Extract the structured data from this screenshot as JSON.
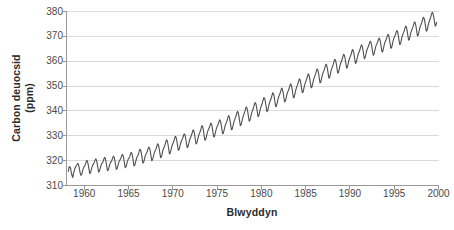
{
  "chart_data": {
    "type": "line",
    "title": "",
    "xlabel": "Blwyddyn",
    "ylabel": "Carbon deuocsid (ppm)",
    "ylabel_line1": "Carbon deuocsid",
    "ylabel_line2": "(ppm)",
    "xlim": [
      1958.0,
      2000.0
    ],
    "ylim": [
      310,
      380
    ],
    "xticks": [
      1960,
      1965,
      1970,
      1975,
      1980,
      1985,
      1990,
      1995,
      2000
    ],
    "xtick_labels": [
      "1960",
      "1965",
      "1970",
      "1975",
      "1980",
      "1985",
      "1990",
      "1995",
      "2000"
    ],
    "yticks": [
      310,
      320,
      330,
      340,
      350,
      360,
      370,
      380
    ],
    "ytick_labels": [
      "310",
      "320",
      "330",
      "340",
      "350",
      "360",
      "370",
      "380"
    ],
    "grid": "horizontal",
    "legend": "none",
    "line_color": "#4f4f4f",
    "grid_color": "#d9d9d9",
    "axis_color": "#9a9a9a",
    "text_color": "#4a4a4a",
    "series": [
      {
        "name": "Carbon deuocsid (ppm)",
        "x": [
          1958.208,
          1958.292,
          1958.375,
          1958.458,
          1958.542,
          1958.625,
          1958.708,
          1958.792,
          1958.875,
          1958.958,
          1959.042,
          1959.125,
          1959.208,
          1959.292,
          1959.375,
          1959.458,
          1959.542,
          1959.625,
          1959.708,
          1959.792,
          1959.875,
          1959.958,
          1960.042,
          1960.125,
          1960.208,
          1960.292,
          1960.375,
          1960.458,
          1960.542,
          1960.625,
          1960.708,
          1960.792,
          1960.875,
          1960.958,
          1961.042,
          1961.125,
          1961.208,
          1961.292,
          1961.375,
          1961.458,
          1961.542,
          1961.625,
          1961.708,
          1961.792,
          1961.875,
          1961.958,
          1962.042,
          1962.125,
          1962.208,
          1962.292,
          1962.375,
          1962.458,
          1962.542,
          1962.625,
          1962.708,
          1962.792,
          1962.875,
          1962.958,
          1963.042,
          1963.125,
          1963.208,
          1963.292,
          1963.375,
          1963.458,
          1963.542,
          1963.625,
          1963.708,
          1963.792,
          1963.875,
          1963.958,
          1964.042,
          1964.125,
          1964.208,
          1964.292,
          1964.375,
          1964.458,
          1964.542,
          1964.625,
          1964.708,
          1964.792,
          1964.875,
          1964.958,
          1965.042,
          1965.125,
          1965.208,
          1965.292,
          1965.375,
          1965.458,
          1965.542,
          1965.625,
          1965.708,
          1965.792,
          1965.875,
          1965.958,
          1966.042,
          1966.125,
          1966.208,
          1966.292,
          1966.375,
          1966.458,
          1966.542,
          1966.625,
          1966.708,
          1966.792,
          1966.875,
          1966.958,
          1967.042,
          1967.125,
          1967.208,
          1967.292,
          1967.375,
          1967.458,
          1967.542,
          1967.625,
          1967.708,
          1967.792,
          1967.875,
          1967.958,
          1968.042,
          1968.125,
          1968.208,
          1968.292,
          1968.375,
          1968.458,
          1968.542,
          1968.625,
          1968.708,
          1968.792,
          1968.875,
          1968.958,
          1969.042,
          1969.125,
          1969.208,
          1969.292,
          1969.375,
          1969.458,
          1969.542,
          1969.625,
          1969.708,
          1969.792,
          1969.875,
          1969.958,
          1970.042,
          1970.125,
          1970.208,
          1970.292,
          1970.375,
          1970.458,
          1970.542,
          1970.625,
          1970.708,
          1970.792,
          1970.875,
          1970.958,
          1971.042,
          1971.125,
          1971.208,
          1971.292,
          1971.375,
          1971.458,
          1971.542,
          1971.625,
          1971.708,
          1971.792,
          1971.875,
          1971.958,
          1972.042,
          1972.125,
          1972.208,
          1972.292,
          1972.375,
          1972.458,
          1972.542,
          1972.625,
          1972.708,
          1972.792,
          1972.875,
          1972.958,
          1973.042,
          1973.125,
          1973.208,
          1973.292,
          1973.375,
          1973.458,
          1973.542,
          1973.625,
          1973.708,
          1973.792,
          1973.875,
          1973.958,
          1974.042,
          1974.125,
          1974.208,
          1974.292,
          1974.375,
          1974.458,
          1974.542,
          1974.625,
          1974.708,
          1974.792,
          1974.875,
          1974.958,
          1975.042,
          1975.125,
          1975.208,
          1975.292,
          1975.375,
          1975.458,
          1975.542,
          1975.625,
          1975.708,
          1975.792,
          1975.875,
          1975.958,
          1976.042,
          1976.125,
          1976.208,
          1976.292,
          1976.375,
          1976.458,
          1976.542,
          1976.625,
          1976.708,
          1976.792,
          1976.875,
          1976.958,
          1977.042,
          1977.125,
          1977.208,
          1977.292,
          1977.375,
          1977.458,
          1977.542,
          1977.625,
          1977.708,
          1977.792,
          1977.875,
          1977.958,
          1978.042,
          1978.125,
          1978.208,
          1978.292,
          1978.375,
          1978.458,
          1978.542,
          1978.625,
          1978.708,
          1978.792,
          1978.875,
          1978.958,
          1979.042,
          1979.125,
          1979.208,
          1979.292,
          1979.375,
          1979.458,
          1979.542,
          1979.625,
          1979.708,
          1979.792,
          1979.875,
          1979.958,
          1980.042,
          1980.125,
          1980.208,
          1980.292,
          1980.375,
          1980.458,
          1980.542,
          1980.625,
          1980.708,
          1980.792,
          1980.875,
          1980.958,
          1981.042,
          1981.125,
          1981.208,
          1981.292,
          1981.375,
          1981.458,
          1981.542,
          1981.625,
          1981.708,
          1981.792,
          1981.875,
          1981.958,
          1982.042,
          1982.125,
          1982.208,
          1982.292,
          1982.375,
          1982.458,
          1982.542,
          1982.625,
          1982.708,
          1982.792,
          1982.875,
          1982.958,
          1983.042,
          1983.125,
          1983.208,
          1983.292,
          1983.375,
          1983.458,
          1983.542,
          1983.625,
          1983.708,
          1983.792,
          1983.875,
          1983.958,
          1984.042,
          1984.125,
          1984.208,
          1984.292,
          1984.375,
          1984.458,
          1984.542,
          1984.625,
          1984.708,
          1984.792,
          1984.875,
          1984.958,
          1985.042,
          1985.125,
          1985.208,
          1985.292,
          1985.375,
          1985.458,
          1985.542,
          1985.625,
          1985.708,
          1985.792,
          1985.875,
          1985.958,
          1986.042,
          1986.125,
          1986.208,
          1986.292,
          1986.375,
          1986.458,
          1986.542,
          1986.625,
          1986.708,
          1986.792,
          1986.875,
          1986.958,
          1987.042,
          1987.125,
          1987.208,
          1987.292,
          1987.375,
          1987.458,
          1987.542,
          1987.625,
          1987.708,
          1987.792,
          1987.875,
          1987.958,
          1988.042,
          1988.125,
          1988.208,
          1988.292,
          1988.375,
          1988.458,
          1988.542,
          1988.625,
          1988.708,
          1988.792,
          1988.875,
          1988.958,
          1989.042,
          1989.125,
          1989.208,
          1989.292,
          1989.375,
          1989.458,
          1989.542,
          1989.625,
          1989.708,
          1989.792,
          1989.875,
          1989.958,
          1990.042,
          1990.125,
          1990.208,
          1990.292,
          1990.375,
          1990.458,
          1990.542,
          1990.625,
          1990.708,
          1990.792,
          1990.875,
          1990.958,
          1991.042,
          1991.125,
          1991.208,
          1991.292,
          1991.375,
          1991.458,
          1991.542,
          1991.625,
          1991.708,
          1991.792,
          1991.875,
          1991.958,
          1992.042,
          1992.125,
          1992.208,
          1992.292,
          1992.375,
          1992.458,
          1992.542,
          1992.625,
          1992.708,
          1992.792,
          1992.875,
          1992.958,
          1993.042,
          1993.125,
          1993.208,
          1993.292,
          1993.375,
          1993.458,
          1993.542,
          1993.625,
          1993.708,
          1993.792,
          1993.875,
          1993.958,
          1994.042,
          1994.125,
          1994.208,
          1994.292,
          1994.375,
          1994.458,
          1994.542,
          1994.625,
          1994.708,
          1994.792,
          1994.875,
          1994.958,
          1995.042,
          1995.125,
          1995.208,
          1995.292,
          1995.375,
          1995.458,
          1995.542,
          1995.625,
          1995.708,
          1995.792,
          1995.875,
          1995.958,
          1996.042,
          1996.125,
          1996.208,
          1996.292,
          1996.375,
          1996.458,
          1996.542,
          1996.625,
          1996.708,
          1996.792,
          1996.875,
          1996.958,
          1997.042,
          1997.125,
          1997.208,
          1997.292,
          1997.375,
          1997.458,
          1997.542,
          1997.625,
          1997.708,
          1997.792,
          1997.875,
          1997.958,
          1998.042,
          1998.125,
          1998.208,
          1998.292,
          1998.375,
          1998.458,
          1998.542,
          1998.625,
          1998.708,
          1998.792,
          1998.875,
          1998.958,
          1999.042,
          1999.125,
          1999.208,
          1999.292,
          1999.375,
          1999.458,
          1999.542,
          1999.625,
          1999.708,
          1999.792
        ],
        "y": [
          315.7,
          317.5,
          317.5,
          317.0,
          315.2,
          314.0,
          313.2,
          314.9,
          315.9,
          317.0,
          317.5,
          318.2,
          318.5,
          318.9,
          318.2,
          316.7,
          315.0,
          314.1,
          314.3,
          315.6,
          316.6,
          317.4,
          317.8,
          318.4,
          319.4,
          320.1,
          319.6,
          318.3,
          316.5,
          314.8,
          315.2,
          316.2,
          317.4,
          318.2,
          318.6,
          319.2,
          320.0,
          320.7,
          320.3,
          319.0,
          317.2,
          315.4,
          315.7,
          316.7,
          317.8,
          318.7,
          319.0,
          319.6,
          320.5,
          321.3,
          321.0,
          319.6,
          317.8,
          316.0,
          316.2,
          317.2,
          318.4,
          319.2,
          319.6,
          320.2,
          321.0,
          321.8,
          321.4,
          320.1,
          318.3,
          316.5,
          316.8,
          317.8,
          319.0,
          319.8,
          320.3,
          320.9,
          321.8,
          322.5,
          322.2,
          320.9,
          319.0,
          317.2,
          317.5,
          318.5,
          319.7,
          320.5,
          320.9,
          321.5,
          322.5,
          323.3,
          323.0,
          321.6,
          319.7,
          317.9,
          318.2,
          319.3,
          320.5,
          321.4,
          322.0,
          322.7,
          323.7,
          324.6,
          324.2,
          322.8,
          320.9,
          319.0,
          319.3,
          320.4,
          321.7,
          322.6,
          323.1,
          323.8,
          324.8,
          325.5,
          325.1,
          323.7,
          321.8,
          320.0,
          320.3,
          321.4,
          322.7,
          323.6,
          324.2,
          324.9,
          325.9,
          326.8,
          326.4,
          325.0,
          323.0,
          321.2,
          321.5,
          322.6,
          324.0,
          324.9,
          325.6,
          326.4,
          327.5,
          328.4,
          328.0,
          326.6,
          324.6,
          322.7,
          323.0,
          324.2,
          325.5,
          326.4,
          327.1,
          327.9,
          328.9,
          329.8,
          329.4,
          328.0,
          326.0,
          324.1,
          324.4,
          325.6,
          326.9,
          327.8,
          328.4,
          329.1,
          330.0,
          330.8,
          330.4,
          329.0,
          327.0,
          325.2,
          325.5,
          326.7,
          328.0,
          328.9,
          329.6,
          330.4,
          331.5,
          332.4,
          332.0,
          330.6,
          328.6,
          326.7,
          327.0,
          328.2,
          329.5,
          330.5,
          331.2,
          332.0,
          333.2,
          334.1,
          333.7,
          332.2,
          330.1,
          328.2,
          328.5,
          329.7,
          331.0,
          332.0,
          332.6,
          333.3,
          334.3,
          335.1,
          334.7,
          333.3,
          331.3,
          329.5,
          329.8,
          331.0,
          332.3,
          333.3,
          333.9,
          334.6,
          335.6,
          336.4,
          336.0,
          334.6,
          332.6,
          330.8,
          331.1,
          332.3,
          333.6,
          334.6,
          335.3,
          336.1,
          337.2,
          338.1,
          337.7,
          336.3,
          334.3,
          332.4,
          332.7,
          333.9,
          335.2,
          336.2,
          337.0,
          337.8,
          338.9,
          339.8,
          339.4,
          338.0,
          336.0,
          334.1,
          334.4,
          335.6,
          337.0,
          338.0,
          338.8,
          339.6,
          340.7,
          341.6,
          341.2,
          339.8,
          337.8,
          335.9,
          336.2,
          337.4,
          338.8,
          339.8,
          340.6,
          341.4,
          342.5,
          343.4,
          343.0,
          341.6,
          339.6,
          337.7,
          338.0,
          339.3,
          340.7,
          341.7,
          342.5,
          343.3,
          344.5,
          345.4,
          345.0,
          343.6,
          341.6,
          339.7,
          340.0,
          341.3,
          342.7,
          343.7,
          344.5,
          345.3,
          346.4,
          347.3,
          346.9,
          345.5,
          343.5,
          341.7,
          342.0,
          343.3,
          344.7,
          345.7,
          346.4,
          347.2,
          348.3,
          349.2,
          348.8,
          347.4,
          345.4,
          343.6,
          343.9,
          345.1,
          346.5,
          347.5,
          348.1,
          348.9,
          350.0,
          350.9,
          350.5,
          349.1,
          347.1,
          345.3,
          345.6,
          346.9,
          348.3,
          349.3,
          350.1,
          350.9,
          352.0,
          352.9,
          352.5,
          351.1,
          349.1,
          347.3,
          347.6,
          348.9,
          350.3,
          351.3,
          352.1,
          352.9,
          354.0,
          354.9,
          354.5,
          353.1,
          351.1,
          349.3,
          349.6,
          350.9,
          352.3,
          353.3,
          354.1,
          354.9,
          356.0,
          356.9,
          356.5,
          355.1,
          353.1,
          351.3,
          351.6,
          352.9,
          354.3,
          355.3,
          356.0,
          356.8,
          357.9,
          358.8,
          358.4,
          357.0,
          355.0,
          353.2,
          353.5,
          354.8,
          356.2,
          357.2,
          358.0,
          358.8,
          359.9,
          360.8,
          360.4,
          359.0,
          357.0,
          355.2,
          355.5,
          356.8,
          358.2,
          359.2,
          360.0,
          360.8,
          361.9,
          362.8,
          362.4,
          361.0,
          359.0,
          357.2,
          357.5,
          358.8,
          360.2,
          361.2,
          361.9,
          362.7,
          363.8,
          364.7,
          364.3,
          362.9,
          360.9,
          359.1,
          359.4,
          360.7,
          362.1,
          363.1,
          363.8,
          364.6,
          365.7,
          366.6,
          366.2,
          364.8,
          362.8,
          361.0,
          361.3,
          362.6,
          364.0,
          365.0,
          365.6,
          366.4,
          367.3,
          368.0,
          367.6,
          366.2,
          364.2,
          362.4,
          362.7,
          364.0,
          365.4,
          366.4,
          366.9,
          367.7,
          368.6,
          369.3,
          368.9,
          367.5,
          365.5,
          363.7,
          364.0,
          365.3,
          366.7,
          367.7,
          368.3,
          369.1,
          370.0,
          370.8,
          370.4,
          369.0,
          367.0,
          365.2,
          365.5,
          366.8,
          368.2,
          369.2,
          369.8,
          370.6,
          371.5,
          372.3,
          371.9,
          370.5,
          368.5,
          366.7,
          367.0,
          368.3,
          369.7,
          370.7,
          371.4,
          372.2,
          373.2,
          374.1,
          373.7,
          372.3,
          370.3,
          368.5,
          368.8,
          370.1,
          371.5,
          372.5,
          373.1,
          373.9,
          374.9,
          375.8,
          375.4,
          374.0,
          372.0,
          370.2,
          370.5,
          371.8,
          373.2,
          374.2,
          374.9,
          375.7,
          376.8,
          377.7,
          377.3,
          375.9,
          373.9,
          372.1,
          372.4,
          373.7,
          375.1,
          376.1,
          376.9,
          377.7,
          378.8,
          379.7,
          379.3,
          377.9,
          375.9,
          374.1,
          374.4,
          375.7
        ]
      }
    ]
  }
}
